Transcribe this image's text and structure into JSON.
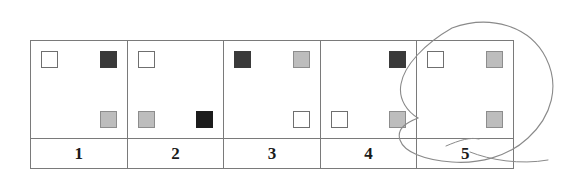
{
  "figure": {
    "type": "grid-table-with-handdrawn-annotation",
    "columns": 5,
    "colors": {
      "white_square": "#ffffff",
      "gray_square": "#bdbdbd",
      "dark_square": "#3a3a3a",
      "black_square": "#1c1c1c",
      "table_border": "#7a7a7a",
      "annotation_ink": "#8a8a8a",
      "background": "#ffffff"
    },
    "cells": [
      {
        "label": "1",
        "squares": [
          {
            "position": "top-left",
            "shade": "white",
            "name": "square-white"
          },
          {
            "position": "top-right",
            "shade": "dark",
            "name": "square-dark"
          },
          {
            "position": "bottom-right",
            "shade": "gray",
            "name": "square-gray"
          }
        ]
      },
      {
        "label": "2",
        "squares": [
          {
            "position": "top-left",
            "shade": "white",
            "name": "square-white"
          },
          {
            "position": "bottom-left",
            "shade": "gray",
            "name": "square-gray"
          },
          {
            "position": "bottom-right",
            "shade": "black",
            "name": "square-black"
          }
        ]
      },
      {
        "label": "3",
        "squares": [
          {
            "position": "top-left",
            "shade": "dark",
            "name": "square-dark"
          },
          {
            "position": "top-right",
            "shade": "gray",
            "name": "square-gray"
          },
          {
            "position": "bottom-right",
            "shade": "white",
            "name": "square-white"
          }
        ]
      },
      {
        "label": "4",
        "squares": [
          {
            "position": "top-right",
            "shade": "dark",
            "name": "square-dark"
          },
          {
            "position": "bottom-left",
            "shade": "white",
            "name": "square-white"
          },
          {
            "position": "bottom-right",
            "shade": "gray",
            "name": "square-gray"
          }
        ]
      },
      {
        "label": "5",
        "squares": [
          {
            "position": "top-left",
            "shade": "white",
            "name": "square-white"
          },
          {
            "position": "top-right",
            "shade": "gray",
            "name": "square-gray"
          },
          {
            "position": "bottom-right",
            "shade": "gray",
            "name": "square-gray"
          }
        ]
      }
    ],
    "annotation": {
      "kind": "hand-drawn-circle",
      "encircles_label": "5",
      "description": "freehand loop drawn around the fifth column with a trailing stroke"
    }
  }
}
